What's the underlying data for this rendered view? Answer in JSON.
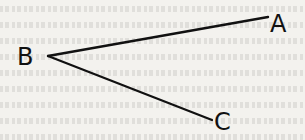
{
  "diagram": {
    "type": "angle",
    "points": {
      "A": {
        "label": "A",
        "x": 270,
        "y": 16
      },
      "B": {
        "label": "B",
        "x": 48,
        "y": 56
      },
      "C": {
        "label": "C",
        "x": 210,
        "y": 120
      }
    },
    "segments": [
      [
        "B",
        "A"
      ],
      [
        "B",
        "C"
      ]
    ],
    "colors": {
      "line": "#111111",
      "background": "#f3f2ee"
    }
  }
}
